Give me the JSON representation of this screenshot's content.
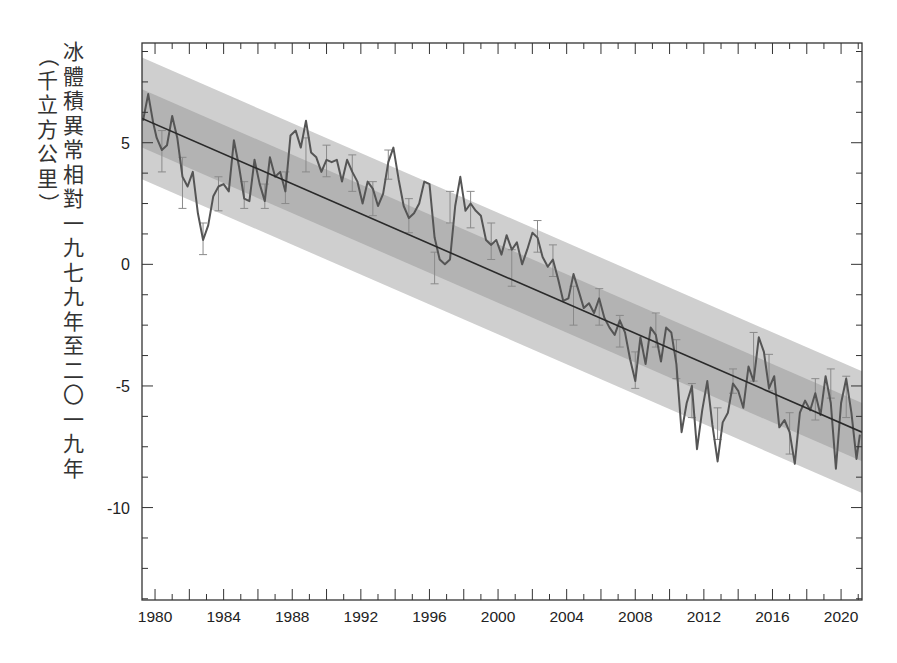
{
  "chart_data": {
    "type": "line",
    "title": "",
    "xlabel": "",
    "ylabel": "冰體積異常相對一九七九年至二〇一九年",
    "ylabel_unit": "（千立方公里）",
    "xlim": [
      1979.24,
      2021.22
    ],
    "ylim": [
      -13.8,
      9.1
    ],
    "x_ticks": [
      1980,
      1984,
      1988,
      1992,
      1996,
      2000,
      2004,
      2008,
      2012,
      2016,
      2020
    ],
    "x_tick_labels": [
      "1980",
      "1984",
      "1988",
      "1992",
      "1996",
      "2000",
      "2004",
      "2008",
      "2012",
      "2016",
      "2020"
    ],
    "y_ticks": [
      5,
      0,
      -5,
      -10
    ],
    "y_tick_labels": [
      "5",
      "0",
      "-5",
      "-10"
    ],
    "grid": false,
    "legend": null,
    "colors": {
      "line": "#555555",
      "trend": "#2a2a2a",
      "band_outer": "#cfcfcf",
      "band_inner": "#b3b3b3",
      "errorbar": "#8a8a8a",
      "axis": "#333333"
    },
    "trend": {
      "x": [
        1979.24,
        2021.22
      ],
      "y": [
        6.0,
        -6.9
      ],
      "inner_band_halfwidth": 1.2,
      "outer_band_halfwidth": 2.5
    },
    "series": [
      {
        "name": "ice volume anomaly",
        "x": [
          1979.3,
          1979.6,
          1979.9,
          1980.1,
          1980.4,
          1980.7,
          1981.0,
          1981.3,
          1981.6,
          1981.9,
          1982.2,
          1982.5,
          1982.8,
          1983.1,
          1983.4,
          1983.7,
          1984.0,
          1984.3,
          1984.6,
          1984.9,
          1985.2,
          1985.5,
          1985.8,
          1986.1,
          1986.4,
          1986.7,
          1987.0,
          1987.3,
          1987.6,
          1987.9,
          1988.2,
          1988.5,
          1988.8,
          1989.1,
          1989.4,
          1989.7,
          1990.0,
          1990.3,
          1990.6,
          1990.9,
          1991.2,
          1991.5,
          1991.8,
          1992.1,
          1992.4,
          1992.7,
          1993.0,
          1993.3,
          1993.6,
          1993.9,
          1994.2,
          1994.5,
          1994.8,
          1995.1,
          1995.4,
          1995.7,
          1996.0,
          1996.3,
          1996.6,
          1996.9,
          1997.2,
          1997.5,
          1997.8,
          1998.1,
          1998.4,
          1998.7,
          1999.0,
          1999.3,
          1999.6,
          1999.9,
          2000.2,
          2000.5,
          2000.8,
          2001.1,
          2001.4,
          2001.7,
          2002.0,
          2002.3,
          2002.6,
          2002.9,
          2003.2,
          2003.5,
          2003.8,
          2004.1,
          2004.4,
          2004.7,
          2005.0,
          2005.3,
          2005.6,
          2005.9,
          2006.2,
          2006.5,
          2006.8,
          2007.1,
          2007.4,
          2007.7,
          2008.0,
          2008.3,
          2008.6,
          2008.9,
          2009.2,
          2009.5,
          2009.8,
          2010.1,
          2010.4,
          2010.7,
          2011.0,
          2011.3,
          2011.6,
          2011.9,
          2012.2,
          2012.5,
          2012.8,
          2013.1,
          2013.4,
          2013.7,
          2014.0,
          2014.3,
          2014.6,
          2014.9,
          2015.2,
          2015.5,
          2015.8,
          2016.1,
          2016.4,
          2016.7,
          2017.0,
          2017.3,
          2017.6,
          2017.9,
          2018.2,
          2018.5,
          2018.8,
          2019.1,
          2019.4,
          2019.7,
          2020.0,
          2020.3,
          2020.6,
          2020.9,
          2021.1
        ],
        "y": [
          5.9,
          7.0,
          5.8,
          5.2,
          4.7,
          4.9,
          6.1,
          5.2,
          3.6,
          3.2,
          3.8,
          2.1,
          1.0,
          1.6,
          2.8,
          3.2,
          3.3,
          3.0,
          5.1,
          4.0,
          2.7,
          2.6,
          4.3,
          3.3,
          2.6,
          4.4,
          3.6,
          3.8,
          3.0,
          5.3,
          5.5,
          4.8,
          5.9,
          4.6,
          4.4,
          3.8,
          4.3,
          4.2,
          4.3,
          3.4,
          4.3,
          3.8,
          3.4,
          2.5,
          3.4,
          3.1,
          2.4,
          2.9,
          4.2,
          4.8,
          3.5,
          2.4,
          1.9,
          2.1,
          2.5,
          3.4,
          3.3,
          1.1,
          0.2,
          0.0,
          0.2,
          2.4,
          3.6,
          2.2,
          2.5,
          2.2,
          2.0,
          1.0,
          0.8,
          1.0,
          0.4,
          1.2,
          0.6,
          0.9,
          0.0,
          0.6,
          1.3,
          1.1,
          0.3,
          -0.1,
          0.2,
          -0.6,
          -1.5,
          -1.4,
          -0.4,
          -1.1,
          -1.8,
          -1.6,
          -2.0,
          -1.4,
          -2.2,
          -2.6,
          -2.9,
          -2.3,
          -2.8,
          -3.9,
          -4.8,
          -3.0,
          -4.1,
          -2.6,
          -2.9,
          -4.0,
          -2.6,
          -2.8,
          -4.1,
          -6.9,
          -5.7,
          -5.0,
          -7.6,
          -6.0,
          -4.8,
          -6.6,
          -8.1,
          -6.5,
          -6.1,
          -4.9,
          -5.2,
          -5.9,
          -4.2,
          -4.8,
          -3.0,
          -3.6,
          -5.1,
          -4.6,
          -6.7,
          -6.4,
          -6.9,
          -8.2,
          -6.1,
          -5.6,
          -6.0,
          -5.3,
          -6.2,
          -4.6,
          -5.7,
          -8.4,
          -5.7,
          -4.7,
          -6.1,
          -8.0,
          -7.0
        ]
      }
    ],
    "errorbars": [
      {
        "x": 1980.4,
        "lo": 3.8,
        "hi": 5.5
      },
      {
        "x": 1981.6,
        "lo": 2.3,
        "hi": 4.4
      },
      {
        "x": 1982.8,
        "lo": 0.4,
        "hi": 1.7
      },
      {
        "x": 1983.7,
        "lo": 2.2,
        "hi": 3.6
      },
      {
        "x": 1985.2,
        "lo": 2.3,
        "hi": 3.4
      },
      {
        "x": 1986.4,
        "lo": 2.3,
        "hi": 3.3
      },
      {
        "x": 1987.6,
        "lo": 2.5,
        "hi": 3.8
      },
      {
        "x": 1988.8,
        "lo": 3.8,
        "hi": 5.2
      },
      {
        "x": 1990.0,
        "lo": 3.6,
        "hi": 4.9
      },
      {
        "x": 1991.5,
        "lo": 3.0,
        "hi": 4.5
      },
      {
        "x": 1992.7,
        "lo": 2.0,
        "hi": 3.4
      },
      {
        "x": 1993.6,
        "lo": 3.5,
        "hi": 4.7
      },
      {
        "x": 1994.8,
        "lo": 1.3,
        "hi": 2.7
      },
      {
        "x": 1996.3,
        "lo": -0.8,
        "hi": 0.5
      },
      {
        "x": 1997.2,
        "lo": 1.7,
        "hi": 3.0
      },
      {
        "x": 1998.4,
        "lo": 1.5,
        "hi": 3.0
      },
      {
        "x": 1999.6,
        "lo": 0.2,
        "hi": 1.7
      },
      {
        "x": 2000.8,
        "lo": -0.9,
        "hi": 0.6
      },
      {
        "x": 2002.3,
        "lo": 0.5,
        "hi": 1.8
      },
      {
        "x": 2003.2,
        "lo": -0.5,
        "hi": 0.8
      },
      {
        "x": 2004.4,
        "lo": -2.5,
        "hi": -0.9
      },
      {
        "x": 2005.9,
        "lo": -2.5,
        "hi": -1.0
      },
      {
        "x": 2007.1,
        "lo": -3.4,
        "hi": -2.1
      },
      {
        "x": 2008.0,
        "lo": -5.1,
        "hi": -3.6
      },
      {
        "x": 2009.2,
        "lo": -3.4,
        "hi": -2.0
      },
      {
        "x": 2010.4,
        "lo": -4.7,
        "hi": -3.1
      },
      {
        "x": 2011.3,
        "lo": -6.3,
        "hi": -4.9
      },
      {
        "x": 2012.8,
        "lo": -7.2,
        "hi": -5.9
      },
      {
        "x": 2013.7,
        "lo": -5.3,
        "hi": -4.3
      },
      {
        "x": 2014.9,
        "lo": -4.8,
        "hi": -2.8
      },
      {
        "x": 2015.8,
        "lo": -5.2,
        "hi": -3.7
      },
      {
        "x": 2017.0,
        "lo": -7.8,
        "hi": -6.1
      },
      {
        "x": 2018.5,
        "lo": -6.4,
        "hi": -4.7
      },
      {
        "x": 2019.4,
        "lo": -5.5,
        "hi": -4.3
      },
      {
        "x": 2020.3,
        "lo": -6.3,
        "hi": -4.6
      }
    ]
  },
  "ylabel_chars": [
    "冰",
    "體",
    "積",
    "異",
    "常",
    "相",
    "對",
    "一",
    "九",
    "七",
    "九",
    "年",
    "至",
    "二",
    "〇",
    "一",
    "九",
    "年"
  ],
  "ylabel_unit_chars": [
    "（",
    "千",
    "立",
    "方",
    "公",
    "里",
    "）"
  ]
}
